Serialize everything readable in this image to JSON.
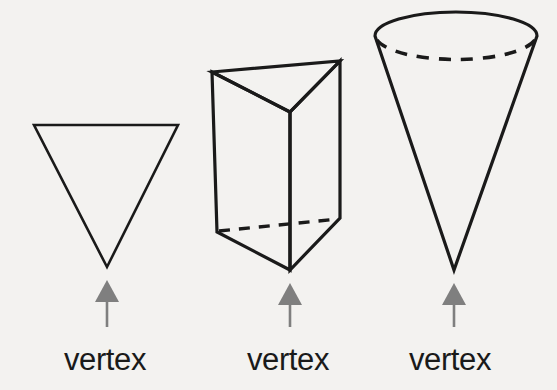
{
  "figure": {
    "background_color": "#f3f2f0",
    "stroke_color": "#1a1a1a",
    "arrow_color": "#7f7f7f",
    "labels": {
      "triangle": "vertex",
      "prism": "vertex",
      "cone": "vertex"
    },
    "shapes": [
      {
        "name": "triangle",
        "type": "triangle",
        "points": "34,125 178,125 107,267",
        "vertex": [
          107,
          267
        ]
      },
      {
        "name": "triangular-prism",
        "type": "prism",
        "top_face": "212,72 340,61 290,112",
        "front_left_face": "212,72 290,112 290,270 217,232",
        "front_right_face": "340,61 290,112 290,270 340,218",
        "hidden_base_edge": "217,232 340,218",
        "vertex": [
          290,
          270
        ]
      },
      {
        "name": "cone",
        "type": "cone",
        "rim_center": [
          456,
          36
        ],
        "rim_rx": 81,
        "rim_ry": 23,
        "apex": [
          454,
          270
        ],
        "vertex": [
          454,
          270
        ]
      }
    ],
    "arrows": [
      {
        "name": "arrow-triangle",
        "tip": [
          107,
          280
        ],
        "tail": [
          107,
          327
        ]
      },
      {
        "name": "arrow-prism",
        "tip": [
          290,
          283
        ],
        "tail": [
          290,
          327
        ]
      },
      {
        "name": "arrow-cone",
        "tip": [
          454,
          283
        ],
        "tail": [
          454,
          327
        ]
      }
    ]
  }
}
